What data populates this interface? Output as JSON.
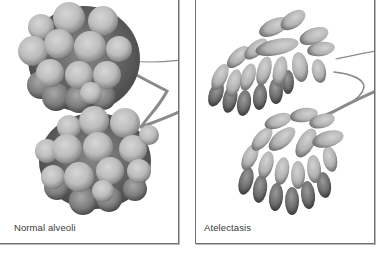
{
  "figure": {
    "panels": [
      {
        "id": "normal",
        "caption": "Normal alveoli",
        "depiction": "two clusters of round, inflated alveolar sacs on branching bronchiole stems"
      },
      {
        "id": "atelectasis",
        "caption": "Atelectasis",
        "depiction": "two clusters of elongated, collapsed (deflated) alveolar sacs on branching bronchiole stems"
      }
    ],
    "colors": {
      "frame": "#6f6f6f",
      "sac_light": "#c9c9c9",
      "sac_mid": "#9a9a9a",
      "sac_dark": "#4a4a4a",
      "stem": "#8a8a8a",
      "caption_text": "#3a3a3a",
      "background": "#ffffff"
    }
  }
}
